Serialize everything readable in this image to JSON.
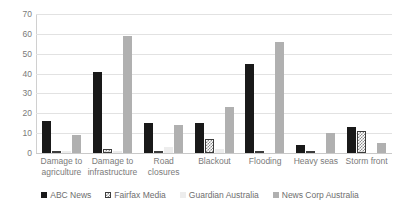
{
  "chart_data": {
    "type": "bar",
    "title": "",
    "subtitle": "",
    "xlabel": "",
    "ylabel": "",
    "ylim": [
      0,
      70
    ],
    "ytick_step": 10,
    "yticks": [
      "70",
      "60",
      "50",
      "40",
      "30",
      "20",
      "10",
      "0"
    ],
    "grid": true,
    "legend_position": "bottom",
    "categories": [
      "Damage to agriculture",
      "Damage to infrastructure",
      "Road closures",
      "Blackout",
      "Flooding",
      "Heavy seas",
      "Storm front"
    ],
    "series": [
      {
        "name": "ABC News",
        "color": "#191919",
        "pattern": "solid",
        "values": [
          16,
          41,
          15,
          15,
          45,
          4,
          13
        ]
      },
      {
        "name": "Fairfax Media",
        "color": "#ffffff",
        "pattern": "checkered",
        "values": [
          0,
          2,
          0,
          7,
          0,
          1,
          11
        ]
      },
      {
        "name": "Guardian Australia",
        "color": "#ededed",
        "pattern": "solid",
        "values": [
          1,
          1,
          3,
          2,
          0,
          0,
          0
        ]
      },
      {
        "name": "News Corp Australia",
        "color": "#b0b0b0",
        "pattern": "solid",
        "values": [
          9,
          59,
          14,
          23,
          56,
          10,
          5
        ]
      }
    ]
  }
}
